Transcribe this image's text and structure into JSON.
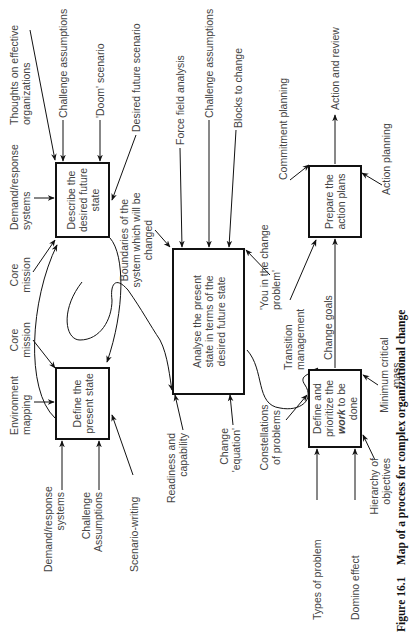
{
  "boxes": {
    "describe": "Describe the desired future state",
    "present": "Define the present state",
    "analyse": "Analyse the present state in terms of the desired future state",
    "work_pre": "Define and prioritize the",
    "work_em": "work",
    "work_post": "to be done",
    "prepare": "Prepare the action plans"
  },
  "labels": {
    "thoughts": "Thoughts on effective organizations",
    "challenge1": "Challenge assumptions",
    "doom": "'Doom' scenario",
    "desired_scenario": "Desired future scenario",
    "demand1": "Demand/response systems",
    "core_mission1": "Core mission",
    "boundaries": "Boundaries of the system which will be changed",
    "core_mission2": "Core mission",
    "env_mapping": "Environment mapping",
    "demand2": "Demand/response systems",
    "challenge_caps": "Challenge Assumptions",
    "scenario_writing": "Scenario-writing",
    "force_field": "Force field analysis",
    "challenge2": "Challenge assumptions",
    "blocks": "Blocks to change",
    "you_in": "'You in the change problem'",
    "readiness": "Readiness and capability",
    "change_eq": "Change 'equation'",
    "transition": "Transition management",
    "change_goals": "Change goals",
    "commitment": "Commitment planning",
    "action_review": "Action and review",
    "action_planning": "Action planning",
    "constellations": "Constellations of problems",
    "types": "Types of problem",
    "domino": "Domino effect",
    "hierarchy": "Hierarchy of objectives",
    "min_mass": "Minimum critical mass"
  },
  "caption": {
    "number": "Figure 16.1",
    "text": "Map of a process for complex organizational change"
  }
}
